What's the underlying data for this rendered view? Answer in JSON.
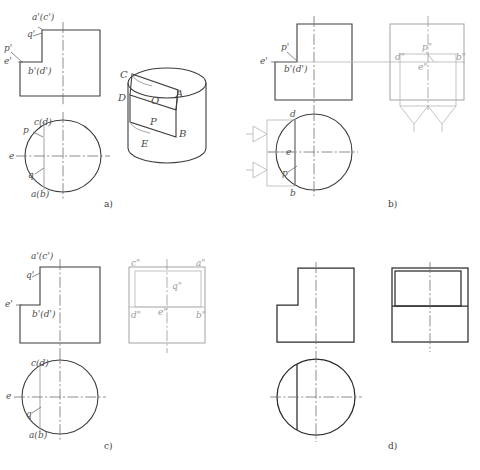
{
  "figure": {
    "title_strip": "",
    "background": "#ffffff",
    "line_color": "#4a4a4a",
    "dark_line_color": "#2b2b2b",
    "faint_line_color": "#9a9a9a",
    "label_color": "#4d4d4d"
  },
  "panels": [
    {
      "id": "a",
      "caption": "a)",
      "front_view": {
        "labels": [
          {
            "key": "a_c_prime",
            "text": "a'(c')"
          },
          {
            "key": "q_prime",
            "text": "q'"
          },
          {
            "key": "p_prime",
            "text": "p'"
          },
          {
            "key": "e_prime",
            "text": "e'"
          },
          {
            "key": "b_d_prime",
            "text": "b'(d')"
          }
        ]
      },
      "top_view": {
        "labels": [
          {
            "key": "c_d",
            "text": "c(d)"
          },
          {
            "key": "p",
            "text": "p"
          },
          {
            "key": "e",
            "text": "e"
          },
          {
            "key": "q",
            "text": "q"
          },
          {
            "key": "a_b",
            "text": "a(b)"
          }
        ]
      },
      "pictorial": {
        "shape": "cylinder",
        "labels": [
          {
            "key": "C",
            "text": "C"
          },
          {
            "key": "D",
            "text": "D"
          },
          {
            "key": "A",
            "text": "A"
          },
          {
            "key": "O",
            "text": "O"
          },
          {
            "key": "P",
            "text": "P"
          },
          {
            "key": "B",
            "text": "B"
          },
          {
            "key": "E",
            "text": "E"
          }
        ]
      }
    },
    {
      "id": "b",
      "caption": "b)",
      "front_view": {
        "labels": [
          {
            "key": "p_prime",
            "text": "p'"
          },
          {
            "key": "e_prime",
            "text": "e'"
          },
          {
            "key": "b_d_prime",
            "text": "b'(d')"
          }
        ]
      },
      "top_view": {
        "labels": [
          {
            "key": "d",
            "text": "d"
          },
          {
            "key": "e",
            "text": "e"
          },
          {
            "key": "p",
            "text": "p"
          },
          {
            "key": "b",
            "text": "b"
          }
        ]
      },
      "side_view": {
        "labels": [
          {
            "key": "d_dprime",
            "text": "d\""
          },
          {
            "key": "p_dprime",
            "text": "p\""
          },
          {
            "key": "e_dprime",
            "text": "e\""
          },
          {
            "key": "b_dprime",
            "text": "b\""
          }
        ]
      }
    },
    {
      "id": "c",
      "caption": "c)",
      "front_view": {
        "labels": [
          {
            "key": "a_c_prime",
            "text": "a'(c')"
          },
          {
            "key": "q_prime",
            "text": "q'"
          },
          {
            "key": "e_prime",
            "text": "e'"
          },
          {
            "key": "b_d_prime",
            "text": "b'(d')"
          }
        ]
      },
      "top_view": {
        "labels": [
          {
            "key": "c_d",
            "text": "c(d)"
          },
          {
            "key": "e",
            "text": "e"
          },
          {
            "key": "q",
            "text": "q"
          },
          {
            "key": "a_b",
            "text": "a(b)"
          }
        ]
      },
      "side_view": {
        "labels": [
          {
            "key": "c_dprime",
            "text": "c\""
          },
          {
            "key": "a_dprime",
            "text": "a\""
          },
          {
            "key": "q_dprime",
            "text": "q\""
          },
          {
            "key": "d_dprime",
            "text": "d\""
          },
          {
            "key": "e_dprime",
            "text": "e\""
          },
          {
            "key": "b_dprime",
            "text": "b\""
          }
        ]
      }
    },
    {
      "id": "d",
      "caption": "d)",
      "front_view": {
        "labels": []
      },
      "top_view": {
        "labels": []
      },
      "side_view": {
        "labels": []
      }
    }
  ]
}
